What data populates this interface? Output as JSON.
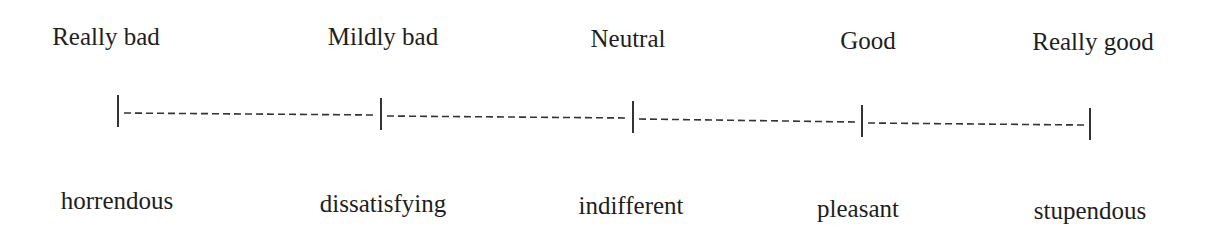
{
  "diagram": {
    "type": "rating-scale",
    "top_labels": [
      {
        "text": "Really bad",
        "x": 106,
        "y": 22
      },
      {
        "text": "Mildly bad",
        "x": 383,
        "y": 22
      },
      {
        "text": "Neutral",
        "x": 628,
        "y": 24
      },
      {
        "text": "Good",
        "x": 868,
        "y": 26
      },
      {
        "text": "Really good",
        "x": 1093,
        "y": 27
      }
    ],
    "bottom_labels": [
      {
        "text": "horrendous",
        "x": 117,
        "y": 186
      },
      {
        "text": "dissatisfying",
        "x": 383,
        "y": 189
      },
      {
        "text": "indifferent",
        "x": 631,
        "y": 191
      },
      {
        "text": "pleasant",
        "x": 858,
        "y": 194
      },
      {
        "text": "stupendous",
        "x": 1090,
        "y": 196
      }
    ],
    "ticks": [
      {
        "x": 118,
        "y": 111
      },
      {
        "x": 381,
        "y": 114
      },
      {
        "x": 633,
        "y": 117
      },
      {
        "x": 862,
        "y": 121
      },
      {
        "x": 1090,
        "y": 124
      }
    ],
    "line_color": "#333333",
    "text_color": "#1e1e1e"
  }
}
